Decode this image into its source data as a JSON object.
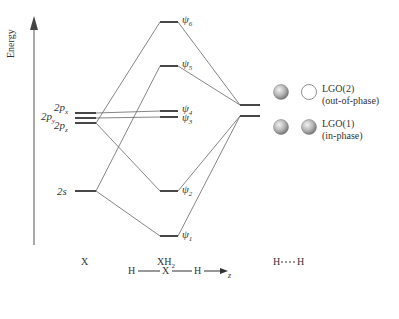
{
  "axis": {
    "label": "Energy"
  },
  "columns": {
    "x": "X",
    "xh2": "XH",
    "xh2_sub": "2",
    "hh": "H----H"
  },
  "x_levels": {
    "p_x": {
      "main": "2p",
      "sub": "x"
    },
    "p_y": {
      "main": "2p",
      "sub": "y"
    },
    "p_z": {
      "main": "2p",
      "sub": "z"
    },
    "s": "2s"
  },
  "mo_levels": [
    {
      "psi": "ψ",
      "n": "6"
    },
    {
      "psi": "ψ",
      "n": "5"
    },
    {
      "psi": "ψ",
      "n": "4"
    },
    {
      "psi": "ψ",
      "n": "3"
    },
    {
      "psi": "ψ",
      "n": "2"
    },
    {
      "psi": "ψ",
      "n": "1"
    }
  ],
  "legend": {
    "lgo2": {
      "title": "LGO(2)",
      "desc": "(out-of-phase)"
    },
    "lgo1": {
      "title": "LGO(1)",
      "desc": "(in-phase)"
    }
  },
  "geometry": {
    "h1": "H",
    "x": "X",
    "h2": "H",
    "axis": "z"
  },
  "colors": {
    "line": "#555555",
    "level": "#333333",
    "sphere": "#9a9a9a"
  }
}
